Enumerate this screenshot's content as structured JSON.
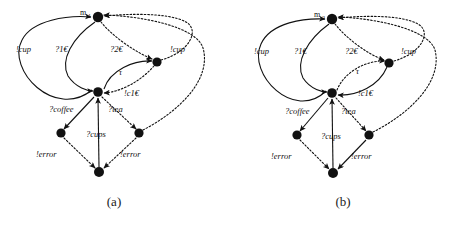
{
  "figure": {
    "panels": [
      {
        "id": "a",
        "caption": "(a)",
        "start_label": "m",
        "start_label_sub": "1",
        "nodes": [
          {
            "name": "m1",
            "x": 98,
            "y": 17,
            "r": 5.2
          },
          {
            "name": "right-upper",
            "x": 157,
            "y": 62,
            "r": 4.6
          },
          {
            "name": "center",
            "x": 98,
            "y": 92,
            "r": 4.8
          },
          {
            "name": "left-lower",
            "x": 61,
            "y": 133,
            "r": 4.6
          },
          {
            "name": "right-lower",
            "x": 139,
            "y": 133,
            "r": 4.6
          },
          {
            "name": "bottom",
            "x": 99,
            "y": 172,
            "r": 5.0
          }
        ],
        "edges": [
          {
            "name": "cup-left",
            "label": "!cup",
            "style": "solid",
            "lx": 24,
            "ly": 48
          },
          {
            "name": "coin1",
            "label": "?1€",
            "style": "solid",
            "lx": 62,
            "ly": 48
          },
          {
            "name": "coin2",
            "label": "?2€",
            "style": "dotted",
            "lx": 116,
            "ly": 48
          },
          {
            "name": "cup-right",
            "label": "!cup",
            "style": "dotted",
            "lx": 178,
            "ly": 48
          },
          {
            "name": "tau",
            "label": "τ",
            "style": "solid",
            "lx": 122,
            "ly": 71
          },
          {
            "name": "change1",
            "label": "!c1€",
            "style": "dotted",
            "lx": 127,
            "ly": 93
          },
          {
            "name": "coffee",
            "label": "?coffee",
            "style": "solid",
            "lx": 51,
            "ly": 110
          },
          {
            "name": "tea",
            "label": "?tea",
            "style": "dotted",
            "lx": 110,
            "ly": 110
          },
          {
            "name": "cups",
            "label": "?cups",
            "style": "solid",
            "lx": 89,
            "ly": 133
          },
          {
            "name": "error-left",
            "label": "!error",
            "style": "dotted",
            "lx": 42,
            "ly": 153
          },
          {
            "name": "error-right",
            "label": "!error",
            "style": "dotted",
            "lx": 126,
            "ly": 153
          }
        ]
      },
      {
        "id": "b",
        "caption": "(b)",
        "start_label": "m",
        "start_label_sub": "2",
        "nodes": [
          {
            "name": "m2",
            "x": 103,
            "y": 19,
            "r": 5.2
          },
          {
            "name": "right-upper",
            "x": 160,
            "y": 63,
            "r": 4.6
          },
          {
            "name": "center",
            "x": 103,
            "y": 93,
            "r": 4.8
          },
          {
            "name": "left-lower",
            "x": 68,
            "y": 135,
            "r": 4.6
          },
          {
            "name": "right-lower",
            "x": 140,
            "y": 135,
            "r": 4.6
          },
          {
            "name": "bottom",
            "x": 104,
            "y": 173,
            "r": 5.0
          }
        ],
        "edges": [
          {
            "name": "cup-left",
            "label": "!cup",
            "style": "solid",
            "lx": 33,
            "ly": 50
          },
          {
            "name": "coin1",
            "label": "?1€",
            "style": "solid",
            "lx": 72,
            "ly": 50
          },
          {
            "name": "coin2",
            "label": "?2€",
            "style": "dotted",
            "lx": 122,
            "ly": 50
          },
          {
            "name": "cup-right",
            "label": "!cup",
            "style": "dotted",
            "lx": 180,
            "ly": 50
          },
          {
            "name": "tau",
            "label": "τ",
            "style": "dotted",
            "lx": 130,
            "ly": 70
          },
          {
            "name": "change1",
            "label": "!c1€",
            "style": "solid",
            "lx": 132,
            "ly": 93
          },
          {
            "name": "coffee",
            "label": "?coffee",
            "style": "solid",
            "lx": 58,
            "ly": 110
          },
          {
            "name": "tea",
            "label": "?tea",
            "style": "dotted",
            "lx": 114,
            "ly": 110
          },
          {
            "name": "cups",
            "label": "?cups",
            "style": "solid",
            "lx": 95,
            "ly": 134
          },
          {
            "name": "error-left",
            "label": "!error",
            "style": "dotted",
            "lx": 48,
            "ly": 154
          },
          {
            "name": "error-right",
            "label": "!error",
            "style": "solid",
            "lx": 128,
            "ly": 154
          }
        ]
      }
    ]
  }
}
